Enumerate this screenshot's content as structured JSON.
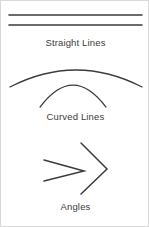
{
  "page": {
    "background_color": "#ffffff",
    "border_color": "#d9d9d9",
    "stroke_color": "#3b3b3b",
    "text_color": "#3b3b3b",
    "width": 149,
    "height": 227
  },
  "sections": [
    {
      "key": "straight",
      "label": "Straight Lines",
      "shape_type": "line",
      "count": 2,
      "shapes": [
        {
          "name": "straight-line-upper",
          "x1": 8,
          "y1": 14,
          "x2": 141,
          "y2": 14
        },
        {
          "name": "straight-line-lower",
          "x1": 8,
          "y1": 24,
          "x2": 141,
          "y2": 24
        }
      ]
    },
    {
      "key": "curved",
      "label": "Curved Lines",
      "shape_type": "arc",
      "count": 2,
      "shapes": [
        {
          "name": "curved-line-outer",
          "x1": 9,
          "y1": 86,
          "cx": 75,
          "cy": 52,
          "x2": 141,
          "y2": 86
        },
        {
          "name": "curved-line-inner",
          "x1": 39,
          "y1": 106,
          "cx": 72,
          "cy": 62,
          "x2": 105,
          "y2": 106
        }
      ]
    },
    {
      "key": "angles",
      "label": "Angles",
      "shape_type": "angle",
      "count": 2,
      "shapes": [
        {
          "name": "angle-wide",
          "x1": 43,
          "y1": 159,
          "vx": 83,
          "vy": 170,
          "x2": 43,
          "y2": 180
        },
        {
          "name": "angle-narrow",
          "x1": 80,
          "y1": 142,
          "vx": 106,
          "vy": 168,
          "x2": 80,
          "y2": 193
        }
      ]
    }
  ]
}
